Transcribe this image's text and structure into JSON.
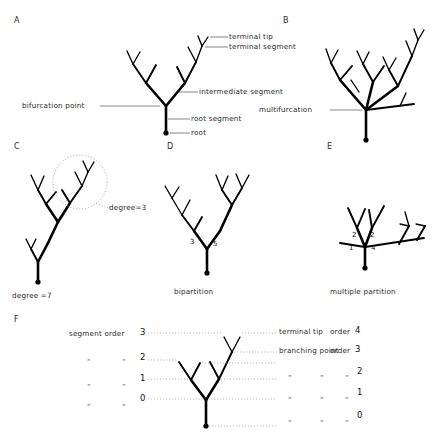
{
  "figure": {
    "panels": [
      {
        "id": "A",
        "label": "A",
        "annotations": [
          {
            "name": "terminal-tip",
            "text": "terminal tip"
          },
          {
            "name": "terminal-segment",
            "text": "terminal segment"
          },
          {
            "name": "intermediate-segment",
            "text": "intermediate segment"
          },
          {
            "name": "root-segment",
            "text": "root segment"
          },
          {
            "name": "root",
            "text": "root"
          },
          {
            "name": "bifurcation-point",
            "text": "bifurcation point"
          }
        ]
      },
      {
        "id": "B",
        "label": "B",
        "annotations": [
          {
            "name": "multifurcation",
            "text": "multifurcation"
          }
        ]
      },
      {
        "id": "C",
        "label": "C",
        "annotations": [
          {
            "name": "degree-3",
            "text": "degree=3"
          },
          {
            "name": "degree-7",
            "text": "degree =7"
          }
        ]
      },
      {
        "id": "D",
        "label": "D",
        "annotations": [
          {
            "name": "bipartition-caption",
            "text": "bipartition"
          }
        ],
        "numbers": [
          "3",
          "5"
        ]
      },
      {
        "id": "E",
        "label": "E",
        "annotations": [
          {
            "name": "multiple-partition-caption",
            "text": "multiple partition"
          }
        ],
        "numbers": [
          "2",
          "2",
          "1",
          "4"
        ]
      },
      {
        "id": "F",
        "label": "F",
        "left_legend": {
          "header": "segment order",
          "header_value": "3",
          "ditto_mark": "„",
          "values": [
            "2",
            "1",
            "0"
          ]
        },
        "right_legend": {
          "row1_label": "terminal tip",
          "row1_order_word": "order",
          "row1_value": "4",
          "row2_label": "branching point",
          "row2_order_word": "order",
          "row2_value": "3",
          "ditto_mark": "„",
          "values": [
            "2",
            "1",
            "0"
          ]
        }
      }
    ]
  },
  "colors": {
    "ink": "#000000",
    "text": "#1f1f1f",
    "leader": "#555555",
    "dotted": "#9a9a9a",
    "background": "#ffffff"
  }
}
